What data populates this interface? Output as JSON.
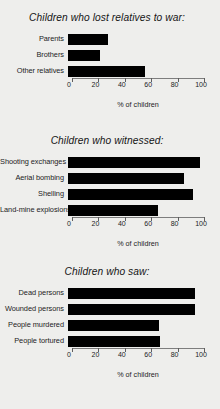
{
  "background_color": "#eeeeec",
  "bar_color": "#000000",
  "axis_color": "#7d7d7d",
  "axis_title": "% of children",
  "chart_data": [
    {
      "type": "bar",
      "orientation": "horizontal",
      "title": "Children who lost relatives to war:",
      "categories": [
        "Parents",
        "Brothers",
        "Other relatives"
      ],
      "values": [
        30,
        24,
        58
      ],
      "xlabel": "% of children",
      "ylabel": "",
      "xlim": [
        0,
        100
      ],
      "xticks": [
        0,
        20,
        40,
        60,
        80,
        100
      ],
      "xticklabels": [
        "0",
        "20",
        "40",
        "60",
        "80",
        "100"
      ],
      "grid": false,
      "legend": false
    },
    {
      "type": "bar",
      "orientation": "horizontal",
      "title": "Children who witnessed:",
      "categories": [
        "Shooting exchanges",
        "Aerial bombing",
        "Shelling",
        "Land-mine explosions"
      ],
      "values": [
        100,
        88,
        95,
        68
      ],
      "xlabel": "% of children",
      "ylabel": "",
      "xlim": [
        0,
        100
      ],
      "xticks": [
        0,
        20,
        40,
        60,
        80,
        100
      ],
      "xticklabels": [
        "0",
        "20",
        "40",
        "60",
        "80",
        "100"
      ],
      "grid": false,
      "legend": false
    },
    {
      "type": "bar",
      "orientation": "horizontal",
      "title": "Children who saw:",
      "categories": [
        "Dead persons",
        "Wounded persons",
        "People murdered",
        "People tortured"
      ],
      "values": [
        96,
        96,
        69,
        70
      ],
      "xlabel": "% of children",
      "ylabel": "",
      "xlim": [
        0,
        100
      ],
      "xticks": [
        0,
        20,
        40,
        60,
        80,
        100
      ],
      "xticklabels": [
        "0",
        "20",
        "40",
        "60",
        "80",
        "100"
      ],
      "grid": false,
      "legend": false
    }
  ]
}
